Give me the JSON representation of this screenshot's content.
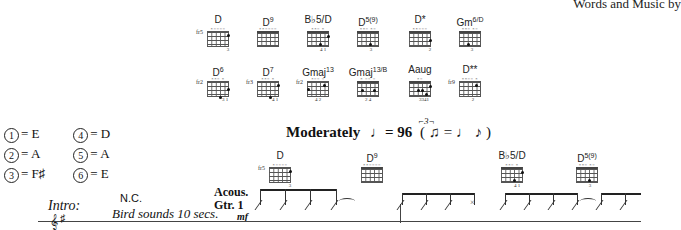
{
  "header": {
    "credit": "Words and Music by"
  },
  "chord_chart": {
    "row1": [
      {
        "name": "D",
        "sup": "",
        "fret": "fr5",
        "marks": "×○○○○",
        "fingers": "3",
        "dots": [
          [
            4,
            0
          ]
        ]
      },
      {
        "name": "D",
        "sup": "9",
        "fret": "",
        "marks": "××○○○○",
        "fingers": "",
        "dots": []
      },
      {
        "name": "B♭5/D",
        "sup": "",
        "fret": "",
        "marks": "××○ ×",
        "fingers": "4  1",
        "dots": [
          [
            4,
            0
          ],
          [
            3,
            2
          ]
        ]
      },
      {
        "name": "D",
        "sup": "5(9)",
        "fret": "",
        "marks": "××○ ×○",
        "fingers": "3",
        "dots": [
          [
            3,
            2
          ]
        ]
      },
      {
        "name": "D*",
        "sup": "",
        "fret": "",
        "marks": "××○○○",
        "fingers": "2",
        "dots": [
          [
            4,
            1
          ]
        ]
      },
      {
        "name": "Gm",
        "sup": "6/D",
        "fret": "",
        "marks": "××○ ×○",
        "fingers": "3",
        "dots": [
          [
            2,
            2
          ]
        ]
      }
    ],
    "row2": [
      {
        "name": "D",
        "sup": "6",
        "fret": "fr2",
        "marks": "××○ ×",
        "fingers": "3  1",
        "dots": [
          [
            4,
            1
          ],
          [
            3,
            3
          ]
        ]
      },
      {
        "name": "D",
        "sup": "7",
        "fret": "fr3",
        "marks": "××○ ×",
        "fingers": "4  1",
        "dots": [
          [
            4,
            1
          ],
          [
            3,
            3
          ]
        ]
      },
      {
        "name": "Gmaj",
        "sup": "13",
        "fret": "fr2",
        "marks": "×○○ ○",
        "fingers": "4   2",
        "dots": [
          [
            0,
            1
          ],
          [
            3,
            0
          ]
        ]
      },
      {
        "name": "Gmaj",
        "sup": "13/B",
        "fret": "",
        "marks": "× ○○ ○",
        "fingers": "2  4",
        "dots": [
          [
            1,
            1
          ],
          [
            4,
            1
          ]
        ]
      },
      {
        "name": "Aaug",
        "sup": "",
        "fret": "",
        "marks": "×○",
        "fingers": "3341",
        "dots": [
          [
            2,
            2
          ],
          [
            3,
            2
          ],
          [
            4,
            3
          ],
          [
            5,
            0
          ]
        ]
      },
      {
        "name": "D**",
        "sup": "",
        "fret": "fr9",
        "marks": "××○○ ×",
        "fingers": "2",
        "dots": [
          [
            3,
            1
          ]
        ]
      }
    ]
  },
  "tuning": {
    "strings": [
      {
        "num": "1",
        "note": "E"
      },
      {
        "num": "2",
        "note": "A"
      },
      {
        "num": "3",
        "note": "F♯"
      },
      {
        "num": "4",
        "note": "D"
      },
      {
        "num": "5",
        "note": "A"
      },
      {
        "num": "6",
        "note": "E"
      }
    ]
  },
  "tempo": {
    "label": "Moderately",
    "bpm": "= 96",
    "swing": "( ♫ = ♩ ♪ )",
    "triplet": "3"
  },
  "section": {
    "label": "Intro:",
    "nc": "N.C.",
    "direction": "Bird sounds 10 secs.",
    "instrument": "Acous.\nGtr. 1",
    "instrument_line1": "Acous.",
    "instrument_line2": "Gtr. 1",
    "dynamic": "mf"
  },
  "staff_chords": [
    {
      "name": "D",
      "sup": "",
      "fret": "fr5",
      "marks": "×○○○○",
      "fingers": "3"
    },
    {
      "name": "D",
      "sup": "9",
      "fret": "",
      "marks": "××○○○○",
      "fingers": ""
    },
    {
      "name": "B♭5/D",
      "sup": "",
      "fret": "",
      "marks": "××○ ×",
      "fingers": "4  1"
    },
    {
      "name": "D",
      "sup": "5(9)",
      "fret": "",
      "marks": "××○ ×○",
      "fingers": "3"
    }
  ]
}
